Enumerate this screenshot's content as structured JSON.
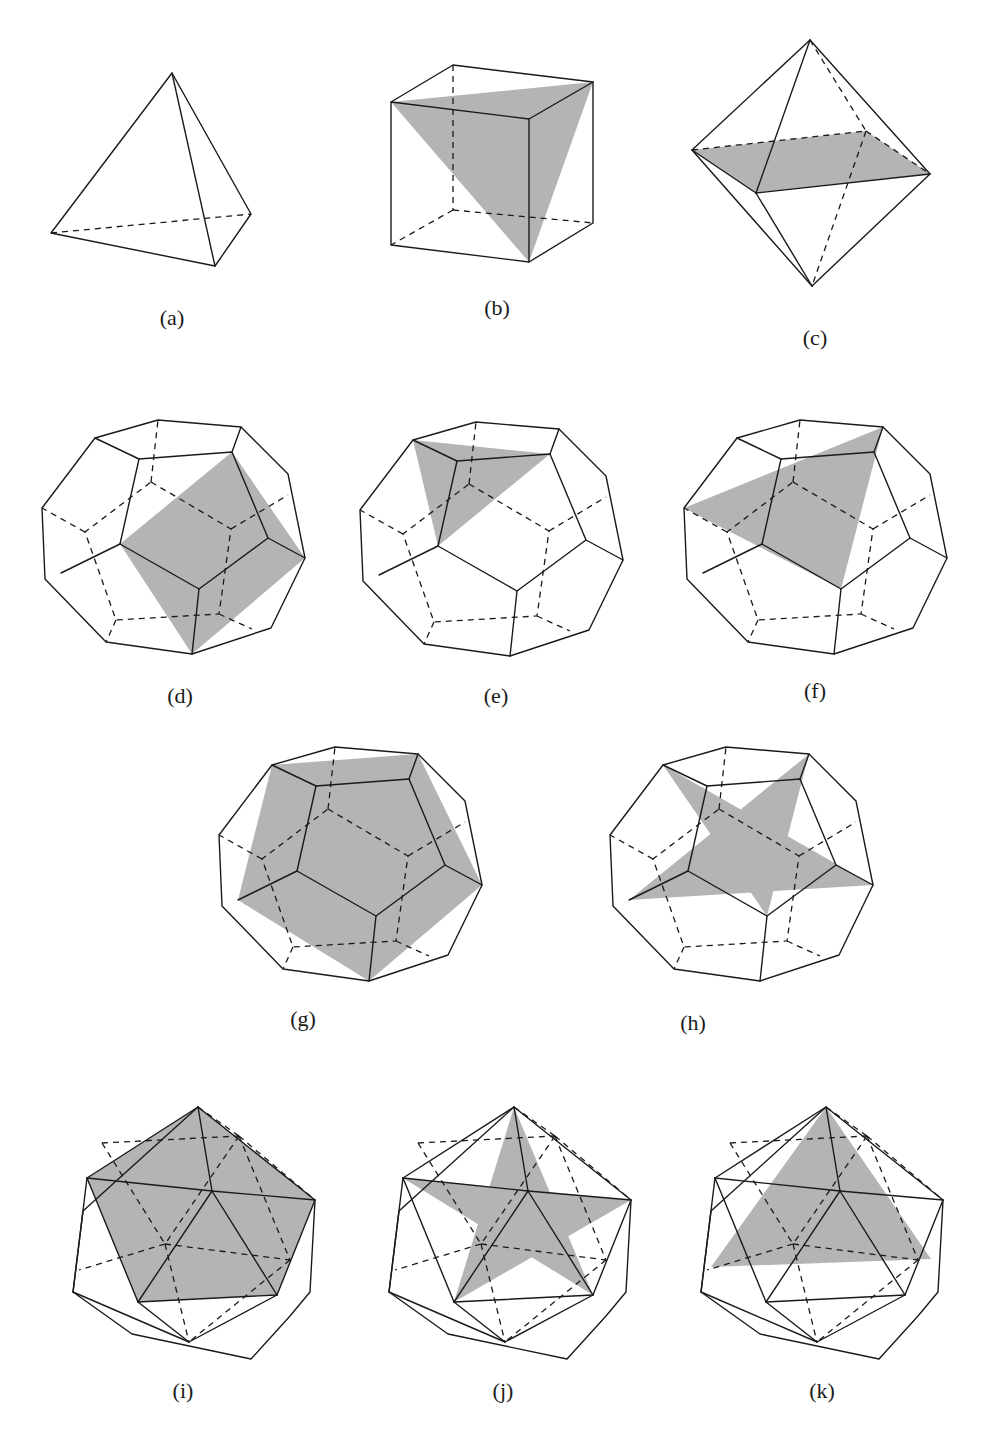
{
  "figure": {
    "shade_color": "#b4b4b4",
    "line_color": "#1a1a1a",
    "panels": [
      {
        "id": "a",
        "label": "(a)",
        "solid": "tetrahedron",
        "shaded": "none"
      },
      {
        "id": "b",
        "label": "(b)",
        "solid": "cube",
        "shaded": "triangle"
      },
      {
        "id": "c",
        "label": "(c)",
        "solid": "octahedron",
        "shaded": "square"
      },
      {
        "id": "d",
        "label": "(d)",
        "solid": "dodecahedron",
        "shaded": "square"
      },
      {
        "id": "e",
        "label": "(e)",
        "solid": "dodecahedron",
        "shaded": "small triangle"
      },
      {
        "id": "f",
        "label": "(f)",
        "solid": "dodecahedron",
        "shaded": "large triangle"
      },
      {
        "id": "g",
        "label": "(g)",
        "solid": "dodecahedron",
        "shaded": "pentagon"
      },
      {
        "id": "h",
        "label": "(h)",
        "solid": "dodecahedron",
        "shaded": "pentagram"
      },
      {
        "id": "i",
        "label": "(i)",
        "solid": "icosahedron",
        "shaded": "pentagon"
      },
      {
        "id": "j",
        "label": "(j)",
        "solid": "icosahedron",
        "shaded": "pentagram"
      },
      {
        "id": "k",
        "label": "(k)",
        "solid": "icosahedron",
        "shaded": "triangle"
      }
    ]
  }
}
